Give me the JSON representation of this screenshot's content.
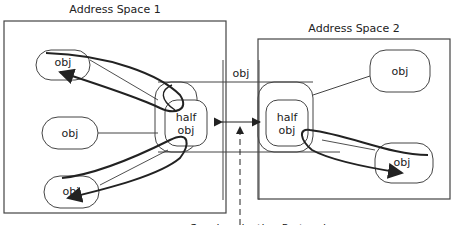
{
  "address_space_1": {
    "title": "Address Space 1"
  },
  "address_space_2": {
    "title": "Address Space 2"
  },
  "shared_object": {
    "label": "obj"
  },
  "space1_objects": [
    {
      "label": "obj"
    },
    {
      "label": "obj"
    },
    {
      "label": "obj"
    }
  ],
  "space2_objects": [
    {
      "label": "obj"
    },
    {
      "label": "obj"
    }
  ],
  "half_obj_1": {
    "line1": "half",
    "line2": "obj"
  },
  "half_obj_2": {
    "line1": "half",
    "line2": "obj"
  },
  "protocol_label": "Synchronization Protocol",
  "colors": {
    "stroke": "#333333",
    "line": "#555555",
    "text": "#222222"
  }
}
